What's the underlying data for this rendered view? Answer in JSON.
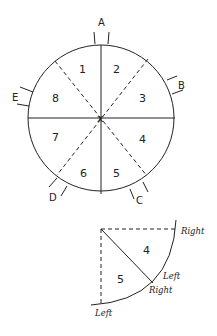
{
  "diagram": {
    "type": "revolving-door-plan",
    "colors": {
      "ink": "#222222",
      "background": "#ffffff"
    },
    "circle": {
      "sections": [
        "1",
        "2",
        "3",
        "4",
        "5",
        "6",
        "7",
        "8"
      ],
      "doors": [
        "A",
        "B",
        "C",
        "D",
        "E"
      ],
      "center_mark": "x"
    },
    "detail": {
      "sections": [
        "4",
        "5"
      ],
      "labels": {
        "right_top": "Right",
        "left_mid": "Left",
        "right_mid": "Right",
        "left_bottom": "Left"
      }
    }
  }
}
